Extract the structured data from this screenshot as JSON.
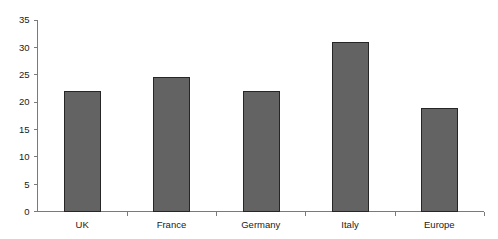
{
  "chart_data": {
    "type": "bar",
    "title": "",
    "subtitle": "",
    "xlabel": "",
    "ylabel": "",
    "categories": [
      "UK",
      "France",
      "Germany",
      "Italy",
      "Europe"
    ],
    "values": [
      22,
      24.5,
      22,
      31,
      19
    ],
    "series": [
      {
        "name": "",
        "values": [
          22,
          24.5,
          22,
          31,
          19
        ]
      }
    ],
    "ylim": [
      0,
      35
    ],
    "ytick_labels": [
      "0",
      "5",
      "10",
      "15",
      "20",
      "25",
      "30",
      "35"
    ],
    "ytick_values": [
      0,
      5,
      10,
      15,
      20,
      25,
      30,
      35
    ],
    "grid": false,
    "legend": false,
    "legend_position": "none",
    "bar_fill_color": "#636363",
    "bar_border_color": "#262626",
    "axis_color": "#7a7a7a",
    "text_color": "#1a1a1a",
    "background_color": "#ffffff"
  }
}
